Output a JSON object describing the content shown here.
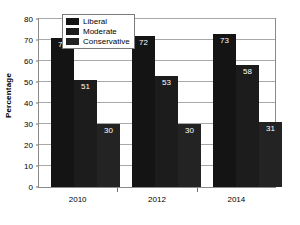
{
  "chart_data": {
    "type": "bar",
    "title": "",
    "xlabel": "",
    "ylabel": "Percentage",
    "categories": [
      "2010",
      "2012",
      "2014"
    ],
    "ylim": [
      0,
      80
    ],
    "yticks": [
      0,
      10,
      20,
      30,
      40,
      50,
      60,
      70,
      80
    ],
    "grid": true,
    "legend_position": "top-left-inside",
    "series": [
      {
        "name": "Liberal",
        "color": "#141414",
        "values": [
          71,
          72,
          73
        ]
      },
      {
        "name": "Moderate",
        "color": "#1c1c1c",
        "values": [
          51,
          53,
          58
        ]
      },
      {
        "name": "Conservative",
        "color": "#232323",
        "values": [
          30,
          30,
          31
        ]
      }
    ],
    "data_labels": [
      "71",
      "51",
      "30",
      "72",
      "53",
      "30",
      "73",
      "58",
      "31"
    ]
  },
  "axis": {
    "y_title": "Percentage",
    "y_tick_labels": [
      "80",
      "70",
      "60",
      "50",
      "40",
      "30",
      "20",
      "10",
      "0"
    ],
    "x_tick_labels": [
      "2010",
      "2012",
      "2014"
    ]
  },
  "legend": {
    "items": [
      {
        "label": "Liberal"
      },
      {
        "label": "Moderate"
      },
      {
        "label": "Conservative"
      }
    ]
  },
  "colors": {
    "liberal": "#141414",
    "moderate": "#1c1c1c",
    "conservative": "#232323",
    "gridline": "#a8a8a8",
    "border": "#8a8a8a",
    "label_text": "#ffffff",
    "background": "#ffffff"
  }
}
